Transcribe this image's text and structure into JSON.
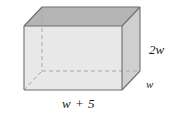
{
  "figure": {
    "name": "rectangular-box",
    "type": "3d-cuboid-oblique-projection"
  },
  "labels": {
    "height": "2w",
    "depth": "w",
    "width": "w + 5"
  },
  "colors": {
    "top_face": "#b4b4b4",
    "front_face": "#e8e8e8",
    "right_face": "#cfcfcf",
    "edge": "#6e6e6e",
    "hidden_edge": "#a8a8a8",
    "background": "#ffffff",
    "text": "#1a1a1a"
  },
  "geometry": {
    "front_top_left": [
      24,
      26
    ],
    "front_top_right": [
      122,
      26
    ],
    "front_bottom_left": [
      24,
      90
    ],
    "front_bottom_right": [
      122,
      90
    ],
    "back_top_left": [
      42,
      7
    ],
    "back_top_right": [
      140,
      7
    ],
    "back_bottom_left": [
      42,
      71
    ],
    "back_bottom_right": [
      140,
      71
    ]
  }
}
